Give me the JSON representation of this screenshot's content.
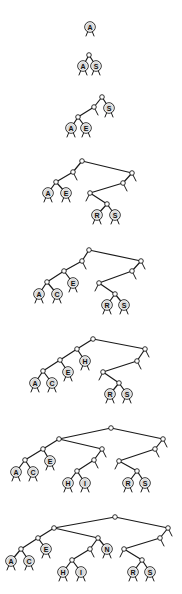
{
  "diagram": {
    "title": "",
    "colors": {
      "edge": "#1a1a1a",
      "leaf_fill": "#d9d9d9",
      "internal_fill": "#ffffff",
      "background": "#ffffff"
    },
    "trees": [
      {
        "id": "tree-1",
        "keys": [
          "A"
        ],
        "internal": [],
        "leaves": [
          {
            "label": "A",
            "x": 90,
            "y": 27
          }
        ],
        "edges": [],
        "nulls": []
      },
      {
        "id": "tree-2",
        "keys": [
          "A",
          "S"
        ],
        "internal": [
          {
            "x": 89,
            "y": 55
          }
        ],
        "leaves": [
          {
            "label": "A",
            "x": 83,
            "y": 66
          },
          {
            "label": "S",
            "x": 96,
            "y": 66
          }
        ],
        "edges": [
          [
            89,
            55,
            83,
            66
          ],
          [
            89,
            55,
            96,
            66
          ]
        ],
        "nulls": []
      },
      {
        "id": "tree-3",
        "keys": [
          "A",
          "S",
          "E"
        ],
        "internal": [
          {
            "x": 102,
            "y": 97
          },
          {
            "x": 94,
            "y": 107
          },
          {
            "x": 78,
            "y": 117
          }
        ],
        "leaves": [
          {
            "label": "S",
            "x": 109,
            "y": 108
          },
          {
            "label": "A",
            "x": 71,
            "y": 128
          },
          {
            "label": "E",
            "x": 86,
            "y": 128
          }
        ],
        "edges": [
          [
            102,
            97,
            94,
            107
          ],
          [
            102,
            97,
            109,
            108
          ],
          [
            94,
            107,
            78,
            117
          ],
          [
            78,
            117,
            71,
            128
          ],
          [
            78,
            117,
            86,
            128
          ]
        ],
        "nulls": [
          [
            94,
            107,
            98,
            115
          ]
        ]
      },
      {
        "id": "tree-4",
        "keys": [
          "A",
          "S",
          "E",
          "R"
        ],
        "internal": [
          {
            "x": 82,
            "y": 161
          },
          {
            "x": 73,
            "y": 172
          },
          {
            "x": 56,
            "y": 182
          },
          {
            "x": 132,
            "y": 173
          },
          {
            "x": 123,
            "y": 183
          },
          {
            "x": 90,
            "y": 193
          },
          {
            "x": 107,
            "y": 204
          }
        ],
        "leaves": [
          {
            "label": "A",
            "x": 48,
            "y": 193
          },
          {
            "label": "E",
            "x": 66,
            "y": 193
          },
          {
            "label": "R",
            "x": 97,
            "y": 215
          },
          {
            "label": "S",
            "x": 115,
            "y": 215
          }
        ],
        "edges": [
          [
            82,
            161,
            73,
            172
          ],
          [
            82,
            161,
            132,
            173
          ],
          [
            73,
            172,
            56,
            182
          ],
          [
            56,
            182,
            48,
            193
          ],
          [
            56,
            182,
            66,
            193
          ],
          [
            132,
            173,
            123,
            183
          ],
          [
            123,
            183,
            90,
            193
          ],
          [
            90,
            193,
            107,
            204
          ],
          [
            107,
            204,
            97,
            215
          ],
          [
            107,
            204,
            115,
            215
          ]
        ],
        "nulls": [
          [
            73,
            172,
            77,
            180
          ],
          [
            132,
            173,
            136,
            181
          ],
          [
            123,
            183,
            127,
            191
          ],
          [
            90,
            193,
            86,
            201
          ]
        ]
      },
      {
        "id": "tree-5",
        "keys": [
          "A",
          "S",
          "E",
          "R",
          "C"
        ],
        "internal": [
          {
            "x": 89,
            "y": 250
          },
          {
            "x": 82,
            "y": 261
          },
          {
            "x": 64,
            "y": 271
          },
          {
            "x": 47,
            "y": 282
          },
          {
            "x": 141,
            "y": 261
          },
          {
            "x": 132,
            "y": 271
          },
          {
            "x": 99,
            "y": 283
          },
          {
            "x": 115,
            "y": 294
          }
        ],
        "leaves": [
          {
            "label": "A",
            "x": 39,
            "y": 294
          },
          {
            "label": "C",
            "x": 57,
            "y": 294
          },
          {
            "label": "E",
            "x": 73,
            "y": 283
          },
          {
            "label": "R",
            "x": 107,
            "y": 305
          },
          {
            "label": "S",
            "x": 124,
            "y": 305
          }
        ],
        "edges": [
          [
            89,
            250,
            82,
            261
          ],
          [
            89,
            250,
            141,
            261
          ],
          [
            82,
            261,
            64,
            271
          ],
          [
            64,
            271,
            47,
            282
          ],
          [
            64,
            271,
            73,
            283
          ],
          [
            47,
            282,
            39,
            294
          ],
          [
            47,
            282,
            57,
            294
          ],
          [
            141,
            261,
            132,
            271
          ],
          [
            132,
            271,
            99,
            283
          ],
          [
            99,
            283,
            115,
            294
          ],
          [
            115,
            294,
            107,
            305
          ],
          [
            115,
            294,
            124,
            305
          ]
        ],
        "nulls": [
          [
            82,
            261,
            86,
            269
          ],
          [
            141,
            261,
            145,
            269
          ],
          [
            132,
            271,
            136,
            279
          ],
          [
            99,
            283,
            95,
            291
          ]
        ]
      },
      {
        "id": "tree-6",
        "keys": [
          "A",
          "S",
          "E",
          "R",
          "C",
          "H"
        ],
        "internal": [
          {
            "x": 93,
            "y": 339
          },
          {
            "x": 77,
            "y": 349
          },
          {
            "x": 60,
            "y": 360
          },
          {
            "x": 43,
            "y": 371
          },
          {
            "x": 145,
            "y": 349
          },
          {
            "x": 137,
            "y": 361
          },
          {
            "x": 103,
            "y": 372
          },
          {
            "x": 119,
            "y": 383
          }
        ],
        "leaves": [
          {
            "label": "H",
            "x": 85,
            "y": 361
          },
          {
            "label": "E",
            "x": 68,
            "y": 372
          },
          {
            "label": "A",
            "x": 35,
            "y": 383
          },
          {
            "label": "C",
            "x": 52,
            "y": 383
          },
          {
            "label": "R",
            "x": 110,
            "y": 394
          },
          {
            "label": "S",
            "x": 127,
            "y": 394
          }
        ],
        "edges": [
          [
            93,
            339,
            77,
            349
          ],
          [
            93,
            339,
            145,
            349
          ],
          [
            77,
            349,
            60,
            360
          ],
          [
            77,
            349,
            85,
            361
          ],
          [
            60,
            360,
            43,
            371
          ],
          [
            60,
            360,
            68,
            372
          ],
          [
            43,
            371,
            35,
            383
          ],
          [
            43,
            371,
            52,
            383
          ],
          [
            145,
            349,
            137,
            361
          ],
          [
            137,
            361,
            103,
            372
          ],
          [
            103,
            372,
            119,
            383
          ],
          [
            119,
            383,
            110,
            394
          ],
          [
            119,
            383,
            127,
            394
          ]
        ],
        "nulls": [
          [
            145,
            349,
            149,
            357
          ],
          [
            137,
            361,
            141,
            369
          ],
          [
            103,
            372,
            99,
            380
          ]
        ]
      },
      {
        "id": "tree-7",
        "keys": [
          "A",
          "S",
          "E",
          "R",
          "C",
          "H",
          "I"
        ],
        "internal": [
          {
            "x": 111,
            "y": 428
          },
          {
            "x": 59,
            "y": 439
          },
          {
            "x": 43,
            "y": 449
          },
          {
            "x": 25,
            "y": 460
          },
          {
            "x": 102,
            "y": 449
          },
          {
            "x": 94,
            "y": 460
          },
          {
            "x": 77,
            "y": 471
          },
          {
            "x": 163,
            "y": 439
          },
          {
            "x": 155,
            "y": 449
          },
          {
            "x": 119,
            "y": 461
          },
          {
            "x": 137,
            "y": 471
          }
        ],
        "leaves": [
          {
            "label": "A",
            "x": 16,
            "y": 472
          },
          {
            "label": "C",
            "x": 33,
            "y": 472
          },
          {
            "label": "E",
            "x": 50,
            "y": 461
          },
          {
            "label": "H",
            "x": 68,
            "y": 483
          },
          {
            "label": "I",
            "x": 85,
            "y": 483
          },
          {
            "label": "R",
            "x": 128,
            "y": 483
          },
          {
            "label": "S",
            "x": 145,
            "y": 483
          }
        ],
        "edges": [
          [
            111,
            428,
            59,
            439
          ],
          [
            111,
            428,
            163,
            439
          ],
          [
            59,
            439,
            43,
            449
          ],
          [
            59,
            439,
            102,
            449
          ],
          [
            43,
            449,
            25,
            460
          ],
          [
            43,
            449,
            50,
            461
          ],
          [
            25,
            460,
            16,
            472
          ],
          [
            25,
            460,
            33,
            472
          ],
          [
            102,
            449,
            94,
            460
          ],
          [
            94,
            460,
            77,
            471
          ],
          [
            77,
            471,
            68,
            483
          ],
          [
            77,
            471,
            85,
            483
          ],
          [
            163,
            439,
            155,
            449
          ],
          [
            155,
            449,
            119,
            461
          ],
          [
            119,
            461,
            137,
            471
          ],
          [
            137,
            471,
            128,
            483
          ],
          [
            137,
            471,
            145,
            483
          ]
        ],
        "nulls": [
          [
            102,
            449,
            106,
            457
          ],
          [
            94,
            460,
            98,
            468
          ],
          [
            163,
            439,
            167,
            447
          ],
          [
            155,
            449,
            159,
            457
          ],
          [
            119,
            461,
            115,
            469
          ]
        ]
      },
      {
        "id": "tree-8",
        "keys": [
          "A",
          "S",
          "E",
          "R",
          "C",
          "H",
          "I",
          "N"
        ],
        "internal": [
          {
            "x": 115,
            "y": 517
          },
          {
            "x": 54,
            "y": 528
          },
          {
            "x": 38,
            "y": 538
          },
          {
            "x": 21,
            "y": 549
          },
          {
            "x": 98,
            "y": 538
          },
          {
            "x": 90,
            "y": 549
          },
          {
            "x": 72,
            "y": 560
          },
          {
            "x": 168,
            "y": 528
          },
          {
            "x": 160,
            "y": 538
          },
          {
            "x": 124,
            "y": 549
          },
          {
            "x": 142,
            "y": 560
          }
        ],
        "leaves": [
          {
            "label": "A",
            "x": 11,
            "y": 561
          },
          {
            "label": "C",
            "x": 29,
            "y": 561
          },
          {
            "label": "E",
            "x": 46,
            "y": 549
          },
          {
            "label": "N",
            "x": 107,
            "y": 549
          },
          {
            "label": "H",
            "x": 63,
            "y": 572
          },
          {
            "label": "I",
            "x": 81,
            "y": 572
          },
          {
            "label": "R",
            "x": 133,
            "y": 572
          },
          {
            "label": "S",
            "x": 150,
            "y": 572
          }
        ],
        "edges": [
          [
            115,
            517,
            54,
            528
          ],
          [
            115,
            517,
            168,
            528
          ],
          [
            54,
            528,
            38,
            538
          ],
          [
            54,
            528,
            98,
            538
          ],
          [
            38,
            538,
            21,
            549
          ],
          [
            38,
            538,
            46,
            549
          ],
          [
            21,
            549,
            11,
            561
          ],
          [
            21,
            549,
            29,
            561
          ],
          [
            98,
            538,
            90,
            549
          ],
          [
            98,
            538,
            107,
            549
          ],
          [
            90,
            549,
            72,
            560
          ],
          [
            72,
            560,
            63,
            572
          ],
          [
            72,
            560,
            81,
            572
          ],
          [
            168,
            528,
            160,
            538
          ],
          [
            160,
            538,
            124,
            549
          ],
          [
            124,
            549,
            142,
            560
          ],
          [
            142,
            560,
            133,
            572
          ],
          [
            142,
            560,
            150,
            572
          ]
        ],
        "nulls": [
          [
            90,
            549,
            94,
            557
          ],
          [
            168,
            528,
            172,
            536
          ],
          [
            160,
            538,
            164,
            546
          ],
          [
            124,
            549,
            120,
            557
          ]
        ]
      }
    ]
  }
}
